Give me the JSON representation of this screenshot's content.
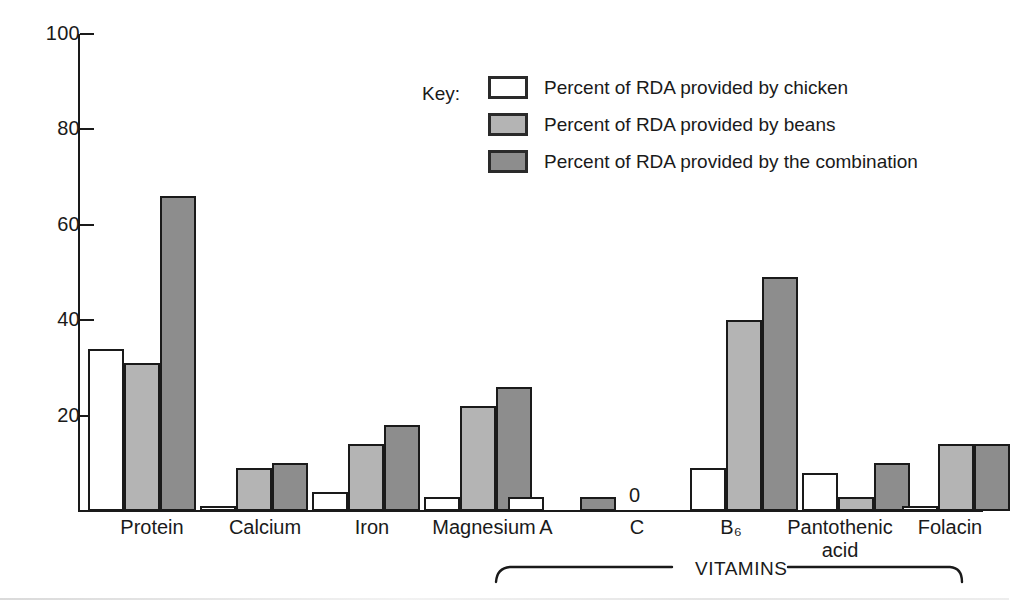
{
  "chart_data": {
    "type": "bar",
    "title": "",
    "xlabel": "",
    "ylabel": "",
    "ylim": [
      0,
      100
    ],
    "yticks": [
      0,
      20,
      40,
      60,
      80,
      100
    ],
    "ytick_labels": [
      "20",
      "40",
      "60",
      "80",
      "100"
    ],
    "grid": false,
    "legend_position": "inside-top-right",
    "legend_title": "Key:",
    "categories": [
      "Protein",
      "Calcium",
      "Iron",
      "Magnesium",
      "A",
      "C",
      "B₆",
      "Pantothenic\nacid",
      "Folacin"
    ],
    "series": [
      {
        "name": "Percent of RDA provided by chicken",
        "key": "chicken",
        "color": "#ffffff",
        "values": [
          34,
          1,
          4,
          3,
          3,
          0,
          9,
          8,
          1
        ]
      },
      {
        "name": "Percent of RDA provided by beans",
        "key": "beans",
        "color": "#b4b4b4",
        "values": [
          31,
          9,
          14,
          22,
          0,
          0,
          40,
          3,
          14
        ]
      },
      {
        "name": "Percent of RDA provided by the combination",
        "key": "combo",
        "color": "#8d8d8d",
        "values": [
          66,
          10,
          18,
          26,
          3,
          0,
          49,
          10,
          14
        ]
      }
    ],
    "annotations": [
      {
        "text": "0",
        "category": "C",
        "note": "zero value marker above Vitamin C baseline"
      }
    ],
    "group_bracket": {
      "label": "VITAMINS",
      "covers": [
        "A",
        "C",
        "B₆",
        "Pantothenic acid",
        "Folacin"
      ]
    }
  },
  "legend": {
    "title": "Key:",
    "items": [
      {
        "label": "Percent of RDA provided by chicken",
        "swatch": "chicken"
      },
      {
        "label": "Percent of RDA provided by beans",
        "swatch": "beans"
      },
      {
        "label": "Percent of RDA provided by the combination",
        "swatch": "combo"
      }
    ]
  },
  "axis": {
    "y_tick_labels": [
      "100",
      "80",
      "60",
      "40",
      "20"
    ]
  },
  "labels": {
    "protein": "Protein",
    "calcium": "Calcium",
    "iron": "Iron",
    "magnesium": "Magnesium",
    "vitamin_a": "A",
    "vitamin_c": "C",
    "vitamin_b6": "B₆",
    "pantothenic_acid": "Pantothenic\nacid",
    "folacin": "Folacin",
    "vitamins_bracket": "VITAMINS",
    "zero_marker": "0"
  },
  "colors": {
    "chicken": "#ffffff",
    "beans": "#b4b4b4",
    "combination": "#8d8d8d",
    "outline": "#1a1a1a",
    "background": "#ffffff"
  }
}
